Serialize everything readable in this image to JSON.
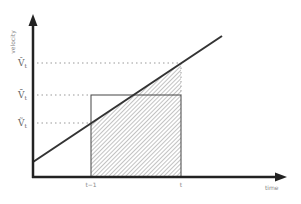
{
  "diagram": {
    "y_axis_label": "velocity",
    "x_axis_label": "time",
    "x_ticks": [
      {
        "label": "t−1",
        "x": 91
      },
      {
        "label": "t",
        "x": 181
      }
    ],
    "y_levels": [
      {
        "label": "V̂",
        "sub": "t",
        "y": 63,
        "name": "v-hat"
      },
      {
        "label": "V̄",
        "sub": "t",
        "y": 95,
        "name": "v-bar"
      },
      {
        "label": "Ṽ",
        "sub": "t",
        "y": 123,
        "name": "v-tilde"
      }
    ],
    "colors": {
      "axis": "#222222",
      "line": "#333333",
      "dotted": "#999999",
      "hatch": "#888888"
    }
  }
}
